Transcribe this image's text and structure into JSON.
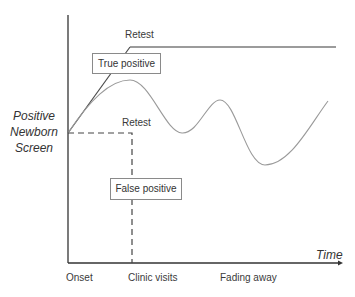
{
  "diagram": {
    "y_axis_label": [
      "Positive",
      "Newborn",
      "Screen"
    ],
    "x_axis_label": "Time",
    "x_ticks": [
      "Onset",
      "Clinic visits",
      "Fading away"
    ],
    "annotations": {
      "retest_top": "Retest",
      "retest_bottom": "Retest",
      "true_positive": "True positive",
      "false_positive": "False positive"
    },
    "paths": {
      "true_positive": "solid dark line rising from screen to retest, then flat",
      "false_positive": "dashed line horizontal to clinic visit then dropping to zero",
      "fading": "light wavy line oscillating and fading over time"
    },
    "colors": {
      "axis": "#333333",
      "true_positive_line": "#4a4a4a",
      "flat_line": "#7a7a7a",
      "wavy_line": "#9a9a9a",
      "dashed_line": "#444444",
      "box_border": "#8a8a8a"
    }
  }
}
